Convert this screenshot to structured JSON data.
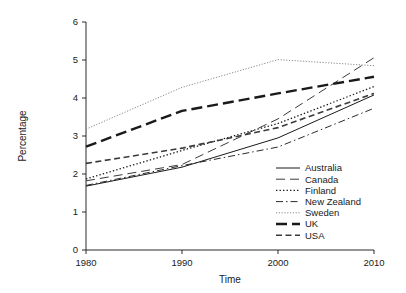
{
  "chart_data": {
    "type": "line",
    "title": "",
    "xlabel": "Time",
    "ylabel": "Percentage",
    "x": [
      1980,
      1990,
      2000,
      2010
    ],
    "xticklabels": [
      "1980",
      "1990",
      "2000",
      "2010"
    ],
    "yticklabels": [
      "0",
      "1",
      "2",
      "3",
      "4",
      "5",
      "6"
    ],
    "yticks": [
      0,
      1,
      2,
      3,
      4,
      5,
      6
    ],
    "xlim": [
      1980,
      2010
    ],
    "ylim": [
      0,
      6
    ],
    "grid": false,
    "legend_position": "bottom-right",
    "series": [
      {
        "name": "Australia",
        "values": [
          1.68,
          2.18,
          2.95,
          4.08
        ],
        "linestyle": "solid",
        "width": 1.0,
        "color": "#1a1a1a",
        "dash": ""
      },
      {
        "name": "Canada",
        "values": [
          1.82,
          2.25,
          3.45,
          5.06
        ],
        "linestyle": "long-dash",
        "width": 1.0,
        "color": "#3a3a3a",
        "dash": "9,5"
      },
      {
        "name": "Finland",
        "values": [
          1.87,
          2.62,
          3.33,
          4.3
        ],
        "linestyle": "dotted",
        "width": 1.3,
        "color": "#1a1a1a",
        "dash": "1.4,2.1"
      },
      {
        "name": "New Zealand",
        "values": [
          1.7,
          2.22,
          2.71,
          3.73
        ],
        "linestyle": "dash-dot",
        "width": 1.0,
        "color": "#2b2b2b",
        "dash": "7,3,1.5,3"
      },
      {
        "name": "Sweden",
        "values": [
          3.18,
          4.28,
          5.01,
          4.85
        ],
        "linestyle": "fine-dotted",
        "width": 1.0,
        "color": "#8a8a8a",
        "dash": "1.2,1.6"
      },
      {
        "name": "UK",
        "values": [
          2.72,
          3.66,
          4.12,
          4.56
        ],
        "linestyle": "thick-long-dash",
        "width": 2.4,
        "color": "#1a1a1a",
        "dash": "11,5"
      },
      {
        "name": "USA",
        "values": [
          2.28,
          2.68,
          3.22,
          4.12
        ],
        "linestyle": "thick-dash",
        "width": 1.6,
        "color": "#3a3a3a",
        "dash": "6,3.5"
      }
    ]
  },
  "legend": {
    "entries": [
      {
        "label": "Australia"
      },
      {
        "label": "Canada"
      },
      {
        "label": "Finland"
      },
      {
        "label": "New Zealand"
      },
      {
        "label": "Sweden"
      },
      {
        "label": "UK"
      },
      {
        "label": "USA"
      }
    ]
  }
}
